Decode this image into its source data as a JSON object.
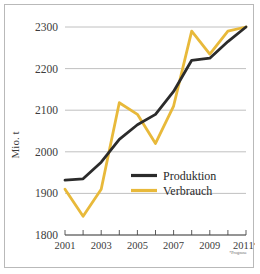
{
  "chart_data": {
    "type": "line",
    "title": "",
    "xlabel": "",
    "ylabel": "Mio. t",
    "ylim": [
      1800,
      2300
    ],
    "yticks": [
      1800,
      1900,
      2000,
      2100,
      2200,
      2300
    ],
    "ytick_labels": [
      "1800",
      "1900",
      "2000",
      "2100",
      "2200",
      "2300"
    ],
    "x": [
      2001,
      2002,
      2003,
      2004,
      2005,
      2006,
      2007,
      2008,
      2009,
      2010,
      2011
    ],
    "xtick_labels": [
      "2001",
      "",
      "2003",
      "",
      "2005",
      "",
      "2007",
      "",
      "2009",
      "",
      "2011*"
    ],
    "grid": true,
    "legend_position": "center-right",
    "annotation": "*Prognose",
    "series": [
      {
        "name": "Produktion",
        "color": "#2b2b2b",
        "values": [
          1932,
          1935,
          1975,
          2030,
          2065,
          2090,
          2145,
          2220,
          2225,
          2265,
          2300
        ]
      },
      {
        "name": "Verbrauch",
        "color": "#e8b93a",
        "values": [
          1910,
          1845,
          1910,
          2118,
          2090,
          2020,
          2110,
          2290,
          2235,
          2290,
          2300
        ]
      }
    ]
  },
  "legend": {
    "items": [
      {
        "label": "Produktion"
      },
      {
        "label": "Verbrauch"
      }
    ]
  },
  "axis": {
    "y_title": "Mio. t"
  },
  "footnote": {
    "text": "*Prognose"
  }
}
